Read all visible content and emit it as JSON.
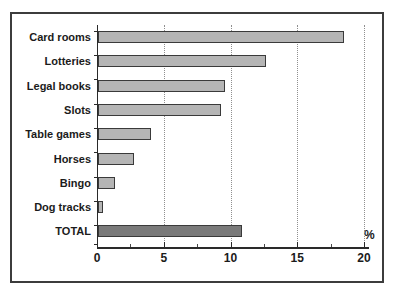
{
  "chart_data": {
    "type": "bar",
    "orientation": "horizontal",
    "title": "",
    "xlabel": "%",
    "ylabel": "",
    "categories": [
      "Card rooms",
      "Lotteries",
      "Legal books",
      "Slots",
      "Table games",
      "Horses",
      "Bingo",
      "Dog tracks",
      "TOTAL"
    ],
    "values": [
      18.4,
      12.6,
      9.5,
      9.2,
      4.0,
      2.7,
      1.3,
      0.4,
      10.8
    ],
    "xlim": [
      0,
      20
    ],
    "xticks": [
      0,
      5,
      10,
      15,
      20
    ],
    "minor_xtick_step": 2.5,
    "grid": "dotted-vertical-at-major-ticks",
    "legend": "none",
    "highlight_category": "TOTAL",
    "colors": {
      "bar_fill": "#b5b5b5",
      "bar_border": "#3a3a3a",
      "total_bar_fill": "#7a7a7a",
      "gridline": "#8f8f8f",
      "axis": "#2a2a2a",
      "text": "#1b1b1b",
      "frame_border": "#3c3c3c",
      "background": "#ffffff"
    }
  }
}
